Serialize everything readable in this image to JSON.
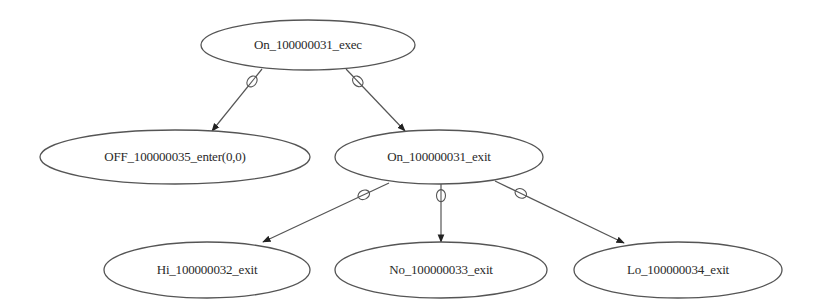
{
  "diagram": {
    "type": "state-transition-tree",
    "colors": {
      "stroke": "#555555",
      "text": "#2a2a2a",
      "background": "#ffffff"
    },
    "nodes": [
      {
        "id": "n0",
        "label": "On_100000031_exec",
        "cx": 308,
        "cy": 45,
        "rx": 107,
        "ry": 25
      },
      {
        "id": "n1",
        "label": "OFF_100000035_enter(0,0)",
        "cx": 175,
        "cy": 157,
        "rx": 135,
        "ry": 27
      },
      {
        "id": "n2",
        "label": "On_100000031_exit",
        "cx": 439,
        "cy": 157,
        "rx": 104,
        "ry": 27
      },
      {
        "id": "n3",
        "label": "Hi_100000032_exit",
        "cx": 207,
        "cy": 270,
        "rx": 103,
        "ry": 28
      },
      {
        "id": "n4",
        "label": "No_100000033_exit",
        "cx": 441,
        "cy": 270,
        "rx": 106,
        "ry": 28
      },
      {
        "id": "n5",
        "label": "Lo_100000034_exit",
        "cx": 678,
        "cy": 270,
        "rx": 104,
        "ry": 28
      }
    ],
    "edges": [
      {
        "from": "n0",
        "to": "n1",
        "x1": 262,
        "y1": 69,
        "x2": 212,
        "y2": 131,
        "marker": "circle-slash"
      },
      {
        "from": "n0",
        "to": "n2",
        "x1": 346,
        "y1": 69,
        "x2": 405,
        "y2": 131,
        "marker": "circle-slash"
      },
      {
        "from": "n2",
        "to": "n3",
        "x1": 389,
        "y1": 183,
        "x2": 263,
        "y2": 242,
        "marker": "circle-slash"
      },
      {
        "from": "n2",
        "to": "n4",
        "x1": 441,
        "y1": 184,
        "x2": 441,
        "y2": 242,
        "marker": "circle-slash"
      },
      {
        "from": "n2",
        "to": "n5",
        "x1": 495,
        "y1": 181,
        "x2": 624,
        "y2": 243,
        "marker": "circle-slash"
      }
    ]
  }
}
